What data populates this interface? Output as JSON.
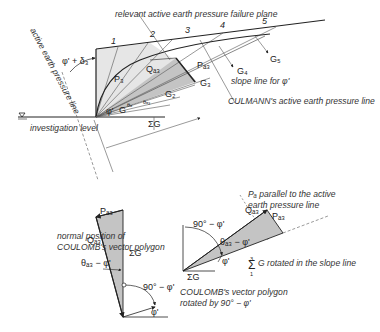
{
  "figure": {
    "top": {
      "title_failure_plane": "relevant active earth pressure failure plane",
      "label_active_line": "active earth pressure line",
      "label_angle_wall": "φ' + δ₃",
      "label_investigation": "investigation level",
      "label_culmann": "CULMANN's active earth pressure line",
      "label_slope_line": "slope line for φ'",
      "wedge_numbers": [
        "1",
        "2",
        "3",
        "4",
        "5"
      ],
      "weights": [
        "G₂",
        "G₃",
        "G₄",
        "G₅"
      ],
      "label_G": "G",
      "label_phi": "φ'",
      "label_theta_a": "θₐ",
      "label_theta_a3": "θₐ₃",
      "label_Pa3": "Pₐ₃",
      "label_Qa3": "Qₐ₃",
      "label_sumG": "ΣG",
      "label_P3": "P₃"
    },
    "bottom_left": {
      "caption_line1": "normal position of",
      "caption_line2": "COULOMB's vector polygon",
      "label_Pa3": "Pₐ₃",
      "label_Qa3": "Qₐ₃",
      "label_sumG": "ΣG",
      "label_sum_top": "3",
      "label_sum_bottom": "1",
      "label_theta": "θₐ₃ − φ'",
      "label_90": "90° − φ'",
      "label_phi": "φ'"
    },
    "bottom_right": {
      "note_line1": "Pₐ parallel to the active",
      "note_line2": "earth pressure line",
      "label_Qa3": "Qₐ₃",
      "label_Pa3": "Pₐ₃",
      "label_90": "90° − φ'",
      "label_theta": "θₐ₃ − φ'",
      "label_phi": "φ'",
      "label_sumG_small": "ΣG",
      "sum_symbol": "Σ",
      "sum_top": "3",
      "sum_bottom": "1",
      "sum_text": "G  rotated in the slope line",
      "caption_line1": "COULOMB's vector polygon",
      "caption_line2": "rotated by 90° − φ'"
    },
    "colors": {
      "line": "#222222",
      "thin_line": "#555555",
      "light_fill": "#e6e6e6",
      "dark_fill": "#c4c4c4",
      "text": "#333333"
    }
  }
}
